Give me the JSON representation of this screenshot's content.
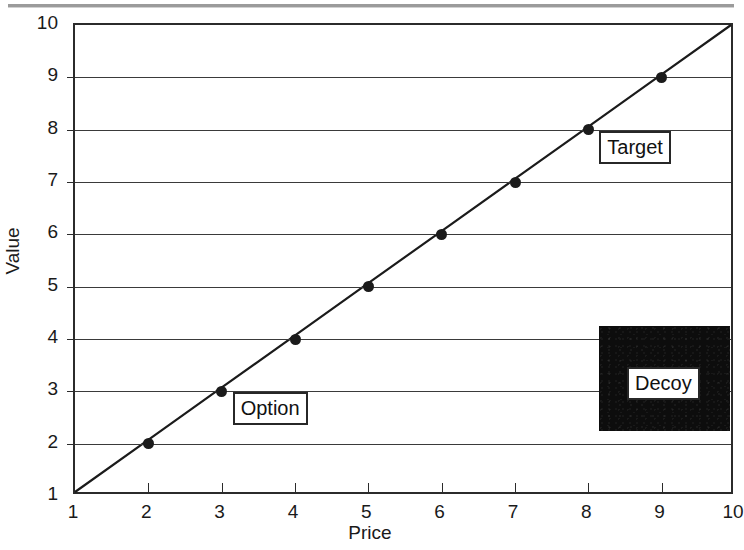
{
  "page": {
    "background": "#ffffff",
    "ink_color": "#1a1a1a",
    "top_rule": "scan-rule"
  },
  "chart_data": {
    "type": "line",
    "title": "",
    "xlabel": "Price",
    "ylabel": "Value",
    "xlim": [
      1,
      10
    ],
    "ylim": [
      1,
      10
    ],
    "xticks": [
      1,
      2,
      3,
      4,
      5,
      6,
      7,
      8,
      9,
      10
    ],
    "yticks": [
      1,
      2,
      3,
      4,
      5,
      6,
      7,
      8,
      9,
      10
    ],
    "xtick_labels": [
      "1",
      "2",
      "3",
      "4",
      "5",
      "6",
      "7",
      "8",
      "9",
      "10"
    ],
    "ytick_labels": [
      "1",
      "2",
      "3",
      "4",
      "5",
      "6",
      "7",
      "8",
      "9",
      "10"
    ],
    "grid": "horizontal",
    "legend": "none",
    "series": [
      {
        "name": "value-vs-price",
        "x": [
          1,
          2,
          3,
          4,
          5,
          6,
          7,
          8,
          9,
          10
        ],
        "values": [
          1,
          2,
          3,
          4,
          5,
          6,
          7,
          8,
          9,
          10
        ],
        "marker": "filled-circle",
        "markers_at": [
          2,
          3,
          4,
          5,
          6,
          7,
          8,
          9
        ],
        "color": "#1b1b1b"
      }
    ],
    "annotations": [
      {
        "label": "Option",
        "x": 3,
        "y": 3,
        "anchor": "right-of-point"
      },
      {
        "label": "Target",
        "x": 8,
        "y": 8,
        "anchor": "right-of-point"
      },
      {
        "label": "Decoy",
        "x": 9.1,
        "y": 3.2,
        "anchor": "inside-black-patch"
      }
    ],
    "shapes": [
      {
        "name": "decoy-patch",
        "type": "rect",
        "fill": "#0d0d0d",
        "x0": 8.15,
        "x1": 9.93,
        "y0": 2.25,
        "y1": 4.25
      }
    ]
  }
}
